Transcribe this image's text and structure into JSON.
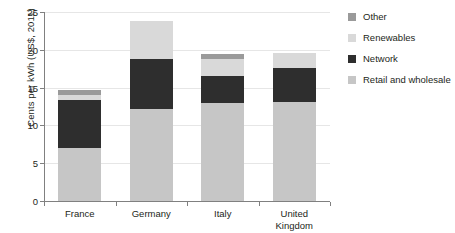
{
  "chart_data": {
    "type": "bar",
    "stacked": true,
    "title": "",
    "xlabel": "",
    "ylabel": "Cents per kWh (US$, 2011)",
    "ylim": [
      0,
      25
    ],
    "yticks": [
      0,
      5,
      10,
      15,
      20,
      25
    ],
    "grid": true,
    "legend_position": "right",
    "categories": [
      "France",
      "Germany",
      "Italy",
      "United Kingdom"
    ],
    "series": [
      {
        "name": "Retail and wholesale",
        "color": "#c6c6c6",
        "values": [
          7.0,
          12.2,
          13.0,
          13.1
        ]
      },
      {
        "name": "Network",
        "color": "#2e2e2e",
        "values": [
          6.3,
          6.6,
          3.5,
          4.5
        ]
      },
      {
        "name": "Renewables",
        "color": "#d9d9d9",
        "values": [
          0.7,
          5.0,
          2.3,
          2.0
        ]
      },
      {
        "name": "Other",
        "color": "#9a9a9a",
        "values": [
          0.7,
          0.0,
          0.7,
          0.0
        ]
      }
    ],
    "totals": [
      14.7,
      23.8,
      19.5,
      19.6
    ]
  },
  "axis": {
    "y": {
      "title": "Cents per kWh (US$, 2011)",
      "ticks": [
        "25",
        "20",
        "15",
        "10",
        "5",
        "0"
      ]
    },
    "x": {
      "labels": [
        "France",
        "Germany",
        "Italy",
        "United\nKingdom"
      ]
    }
  },
  "legend": {
    "items": [
      {
        "label": "Other",
        "color": "#9a9a9a"
      },
      {
        "label": "Renewables",
        "color": "#d9d9d9"
      },
      {
        "label": "Network",
        "color": "#2e2e2e"
      },
      {
        "label": "Retail and wholesale",
        "color": "#c6c6c6"
      }
    ]
  }
}
